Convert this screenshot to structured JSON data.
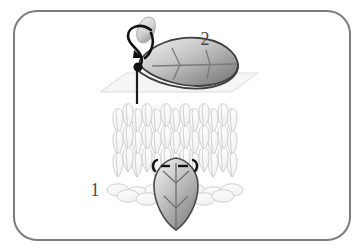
{
  "figure": {
    "title": "",
    "background_color": "#ffffff",
    "border": {
      "name": "rounded-frame",
      "color": "#7d7d7d",
      "corner_radius": 22,
      "stroke_width": 2
    },
    "labels": [
      {
        "id": "step-1",
        "text": "1",
        "x": 95,
        "y": 196
      },
      {
        "id": "step-2",
        "text": "2",
        "x": 205,
        "y": 45
      }
    ],
    "colors": {
      "frame": "#7d7d7d",
      "leaf_outline": "#4a4a4a",
      "leaf_light": "#f2f2f2",
      "leaf_mid": "#bdbdbd",
      "leaf_dark": "#6e6e6e",
      "knit_outline": "#cfcfcf",
      "knit_fill": "#fafafa",
      "plane_fill": "#f4f4f4",
      "plane_outline": "#d8d8d8",
      "thread": "#111111",
      "needle_light": "#e8e8e8",
      "needle_dark": "#9a9a9a",
      "vein": "#8a8a8a",
      "label_text": "#4a4a4a"
    },
    "panels": [
      {
        "id": "lower-panel",
        "name": "duplicate-stitch-on-knit-fabric",
        "step_label": "1",
        "description": "Leaf motif worked in duplicate stitch over stockinette knit fabric",
        "elements": [
          "knit-fabric-swatch",
          "leaf-motif",
          "stitch-dash-marks",
          "stitch-hook-marks"
        ]
      },
      {
        "id": "upper-panel",
        "name": "needle-through-leaf-detail",
        "step_label": "2",
        "description": "Threaded needle entering the fabric plane beneath a leaf shape",
        "elements": [
          "fabric-plane",
          "leaf-shape",
          "sewing-needle",
          "thread-loop",
          "thread-knot"
        ]
      }
    ],
    "knit": {
      "name": "knit-fabric-swatch",
      "columns": 7,
      "rows": 4,
      "stitch_shape": "v-stitch",
      "left": 110,
      "right": 246,
      "top": 108,
      "bottom": 196
    },
    "plane": {
      "name": "fabric-plane",
      "shape": "parallelogram",
      "points": "100,92 128,72 258,72 232,92"
    }
  }
}
